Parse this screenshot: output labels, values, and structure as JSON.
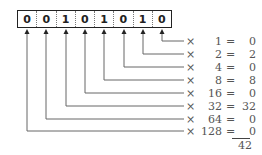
{
  "diagram": {
    "bits": [
      "0",
      "0",
      "1",
      "0",
      "1",
      "0",
      "1",
      "0"
    ],
    "rows": [
      {
        "times": "×",
        "multiplier": "1",
        "equals": "=",
        "result": "0"
      },
      {
        "times": "×",
        "multiplier": "2",
        "equals": "=",
        "result": "2"
      },
      {
        "times": "×",
        "multiplier": "4",
        "equals": "=",
        "result": "0"
      },
      {
        "times": "×",
        "multiplier": "8",
        "equals": "=",
        "result": "8"
      },
      {
        "times": "×",
        "multiplier": "16",
        "equals": "=",
        "result": "0"
      },
      {
        "times": "×",
        "multiplier": "32",
        "equals": "=",
        "result": "32"
      },
      {
        "times": "×",
        "multiplier": "64",
        "equals": "=",
        "result": "0"
      },
      {
        "times": "×",
        "multiplier": "128",
        "equals": "=",
        "result": "0"
      }
    ],
    "total": "42",
    "colors": {
      "line": "#666666",
      "text": "#555555",
      "box": "#222222"
    }
  }
}
